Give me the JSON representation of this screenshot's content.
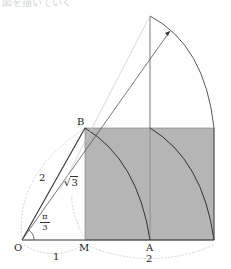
{
  "labels": {
    "O": "O",
    "M": "M",
    "A": "A",
    "B": "B",
    "len_OM": "1",
    "len_MR": "2",
    "len_OB": "2",
    "sqrt_symbol": "√",
    "sqrt_radicand": "3",
    "angle_num": "π",
    "angle_den": "3"
  },
  "colors": {
    "fill": "#b5b5b5",
    "stroke": "#333333",
    "light_stroke": "#bdbdbd",
    "dotted": "#c8c8c8"
  },
  "top_cut_text": "図を描いていく"
}
